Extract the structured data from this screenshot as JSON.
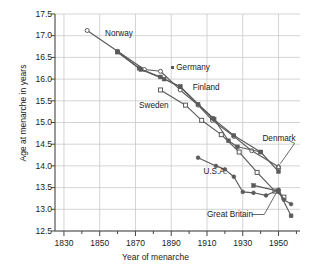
{
  "chart_data": {
    "type": "line",
    "title": "",
    "xlabel": "Year of menarche",
    "ylabel": "Age at menarche in years",
    "xlim": [
      1825,
      1962
    ],
    "ylim": [
      12.5,
      17.5
    ],
    "xticks": [
      1830,
      1850,
      1870,
      1890,
      1910,
      1930,
      1950
    ],
    "yticks": [
      "12.5",
      "13.0",
      "13.5",
      "14.0",
      "14.5",
      "15.0",
      "15.5",
      "16.0",
      "16.5",
      "17.0",
      "17.5"
    ],
    "grid": true,
    "legend_position": "inline-annotations",
    "series": [
      {
        "name": "Norway",
        "marker": "open-circle",
        "points": [
          [
            1843,
            17.12
          ],
          [
            1860,
            16.64
          ],
          [
            1875,
            16.22
          ],
          [
            1884,
            16.18
          ],
          [
            1895,
            15.75
          ],
          [
            1905,
            15.4
          ],
          [
            1913,
            15.05
          ],
          [
            1925,
            14.68
          ],
          [
            1935,
            14.35
          ],
          [
            1950,
            13.98
          ]
        ]
      },
      {
        "name": "Germany",
        "marker": "filled-square",
        "points": [
          [
            1860,
            16.63
          ],
          [
            1872,
            16.25
          ],
          [
            1884,
            16.05
          ],
          [
            1895,
            15.82
          ],
          [
            1905,
            15.42
          ],
          [
            1914,
            15.08
          ],
          [
            1922,
            14.58
          ],
          [
            1927,
            14.44
          ],
          [
            1940,
            14.32
          ]
        ]
      },
      {
        "name": "Finland",
        "marker": "filled-square",
        "points": [
          [
            1860,
            16.62
          ],
          [
            1873,
            16.22
          ],
          [
            1886,
            16.0
          ],
          [
            1895,
            15.83
          ],
          [
            1913,
            15.1
          ],
          [
            1925,
            14.7
          ],
          [
            1940,
            14.32
          ],
          [
            1950,
            13.87
          ]
        ]
      },
      {
        "name": "Sweden",
        "marker": "open-square",
        "points": [
          [
            1884,
            15.75
          ],
          [
            1898,
            15.4
          ],
          [
            1907,
            15.05
          ],
          [
            1918,
            14.72
          ],
          [
            1928,
            14.32
          ],
          [
            1938,
            13.85
          ],
          [
            1948,
            13.42
          ],
          [
            1953,
            13.28
          ]
        ]
      },
      {
        "name": "Denmark",
        "marker": "open-triangle",
        "points": [
          [
            1950,
            13.98
          ]
        ]
      },
      {
        "name": "U.S.A.",
        "marker": "filled-circle",
        "points": [
          [
            1905,
            14.19
          ],
          [
            1915,
            14.0
          ],
          [
            1920,
            13.92
          ],
          [
            1925,
            13.75
          ],
          [
            1930,
            13.4
          ],
          [
            1936,
            13.38
          ],
          [
            1943,
            13.32
          ],
          [
            1950,
            13.45
          ],
          [
            1953,
            13.22
          ],
          [
            1957,
            13.12
          ]
        ]
      },
      {
        "name": "Great Britain",
        "marker": "filled-square",
        "points": [
          [
            1936,
            13.55
          ],
          [
            1950,
            13.42
          ],
          [
            1957,
            12.85
          ]
        ]
      }
    ],
    "annotations": [
      {
        "text": "Norway",
        "x": 1853,
        "y": 17.05,
        "marker": "none"
      },
      {
        "text": "Germany",
        "x": 1890,
        "y": 16.25,
        "marker": "filled-square"
      },
      {
        "text": "Finland",
        "x": 1902,
        "y": 15.8,
        "marker": "none"
      },
      {
        "text": "Sweden",
        "x": 1872,
        "y": 15.38,
        "marker": "none"
      },
      {
        "text": "Denmark",
        "x": 1941,
        "y": 14.62,
        "marker": "none"
      },
      {
        "text": "U.S.A.",
        "x": 1908,
        "y": 13.85,
        "marker": "none"
      },
      {
        "text": "Great Britain",
        "x": 1910,
        "y": 12.88,
        "marker": "none"
      }
    ]
  }
}
